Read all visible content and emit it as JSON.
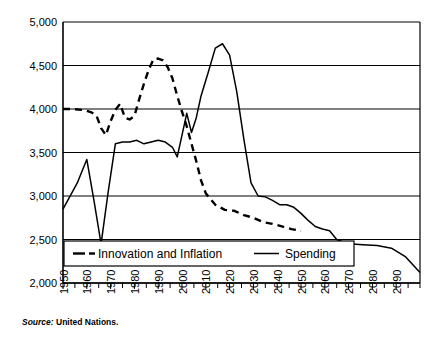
{
  "source": {
    "label": "Source:",
    "text": "United Nations."
  },
  "chart_data": {
    "type": "line",
    "title": "",
    "xlabel": "",
    "ylabel": "",
    "xlim": [
      1950,
      2100
    ],
    "ylim": [
      2000,
      5000
    ],
    "grid": true,
    "grid_axis": "y",
    "legend_position": "bottom-inside",
    "ytick_labels": [
      "5,000",
      "4,500",
      "4,000",
      "3,500",
      "3,000",
      "2,500",
      "2,000"
    ],
    "ytick_values": [
      5000,
      4500,
      4000,
      3500,
      3000,
      2500,
      2000
    ],
    "xtick_labels": [
      "1950",
      "1960",
      "1970",
      "1980",
      "1990",
      "2000",
      "2010",
      "2020",
      "2030",
      "2040",
      "2050",
      "2060",
      "2070",
      "2080",
      "2090"
    ],
    "xtick_values": [
      1950,
      1960,
      1970,
      1980,
      1990,
      2000,
      2010,
      2020,
      2030,
      2040,
      2050,
      2060,
      2070,
      2080,
      2090
    ],
    "minor_xtick_interval": 5,
    "series": [
      {
        "name": "Innovation and Inflation",
        "style": "dashed",
        "color": "#000000",
        "x": [
          1950,
          1954,
          1958,
          1960,
          1962,
          1964,
          1966,
          1968,
          1970,
          1972,
          1974,
          1976,
          1978,
          1980,
          1982,
          1984,
          1986,
          1988,
          1990,
          1992,
          1994,
          1996,
          1998,
          2000,
          2002,
          2004,
          2006,
          2008,
          2010,
          2014,
          2018,
          2022,
          2026,
          2030,
          2034,
          2038,
          2042,
          2046,
          2050
        ],
        "y": [
          4000,
          4000,
          3990,
          3980,
          3960,
          3930,
          3780,
          3700,
          3860,
          3990,
          4060,
          3900,
          3880,
          3920,
          4110,
          4290,
          4450,
          4570,
          4580,
          4560,
          4480,
          4350,
          4150,
          3970,
          3800,
          3600,
          3400,
          3180,
          3030,
          2900,
          2840,
          2830,
          2780,
          2750,
          2700,
          2680,
          2650,
          2620,
          2600
        ]
      },
      {
        "name": "Spending",
        "style": "solid",
        "color": "#000000",
        "x": [
          1950,
          1956,
          1960,
          1963,
          1966,
          1969,
          1972,
          1975,
          1978,
          1981,
          1984,
          1987,
          1990,
          1993,
          1996,
          1998,
          2000,
          2002,
          2004,
          2006,
          2008,
          2011,
          2014,
          2017,
          2020,
          2023,
          2026,
          2029,
          2032,
          2035,
          2038,
          2041,
          2044,
          2047,
          2050,
          2053,
          2056,
          2059,
          2062,
          2065,
          2070,
          2076,
          2082,
          2088,
          2094,
          2100
        ],
        "y": [
          2850,
          3150,
          3420,
          2950,
          2450,
          3050,
          3600,
          3620,
          3620,
          3640,
          3600,
          3620,
          3640,
          3620,
          3560,
          3450,
          3700,
          3950,
          3730,
          3900,
          4150,
          4420,
          4700,
          4750,
          4620,
          4200,
          3650,
          3150,
          3000,
          2990,
          2950,
          2900,
          2900,
          2870,
          2800,
          2720,
          2650,
          2620,
          2600,
          2500,
          2450,
          2440,
          2430,
          2400,
          2300,
          2120
        ]
      }
    ]
  }
}
